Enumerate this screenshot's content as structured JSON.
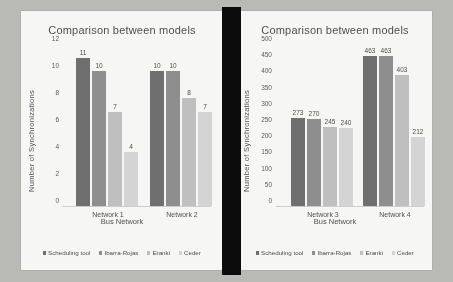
{
  "document": {
    "background_color": "#b9b9b5",
    "page_color": "#fbfbfa",
    "gutter_color": "#0c0c0c"
  },
  "series_colors": [
    "#6e6e6e",
    "#8f8f8f",
    "#c2c2c2",
    "#d7d7d7"
  ],
  "legend": {
    "items": [
      {
        "label": "Scheduling tool",
        "color": "#6e6e6e"
      },
      {
        "label": "Ibarra-Rojas",
        "color": "#8f8f8f"
      },
      {
        "label": "Eranki",
        "color": "#c2c2c2"
      },
      {
        "label": "Ceder",
        "color": "#d7d7d7"
      }
    ]
  },
  "chart_data": [
    {
      "type": "bar",
      "title": "Comparison between models",
      "xlabel": "Bus Network",
      "ylabel": "Number  of Synchronizations",
      "categories": [
        "Network 1",
        "Network 2"
      ],
      "yticks": [
        12,
        10,
        8,
        6,
        4,
        2,
        0
      ],
      "ylim": [
        0,
        12
      ],
      "grid": false,
      "legend_position": "bottom",
      "series": [
        {
          "name": "Scheduling tool",
          "values": [
            11,
            10
          ]
        },
        {
          "name": "Ibarra-Rojas",
          "values": [
            10,
            10
          ]
        },
        {
          "name": "Eranki",
          "values": [
            7,
            8
          ]
        },
        {
          "name": "Ceder",
          "values": [
            4,
            7
          ]
        }
      ]
    },
    {
      "type": "bar",
      "title": "Comparison between models",
      "xlabel": "Bus Network",
      "ylabel": "Number  of Synchronizations",
      "categories": [
        "Network 3",
        "Network 4"
      ],
      "yticks": [
        500,
        450,
        400,
        350,
        300,
        250,
        200,
        150,
        100,
        50,
        0
      ],
      "ylim": [
        0,
        500
      ],
      "grid": false,
      "legend_position": "bottom",
      "series": [
        {
          "name": "Scheduling tool",
          "values": [
            273,
            463
          ]
        },
        {
          "name": "Ibarra-Rojas",
          "values": [
            270,
            463
          ]
        },
        {
          "name": "Eranki",
          "values": [
            245,
            403
          ]
        },
        {
          "name": "Ceder",
          "values": [
            240,
            212
          ]
        }
      ]
    }
  ]
}
